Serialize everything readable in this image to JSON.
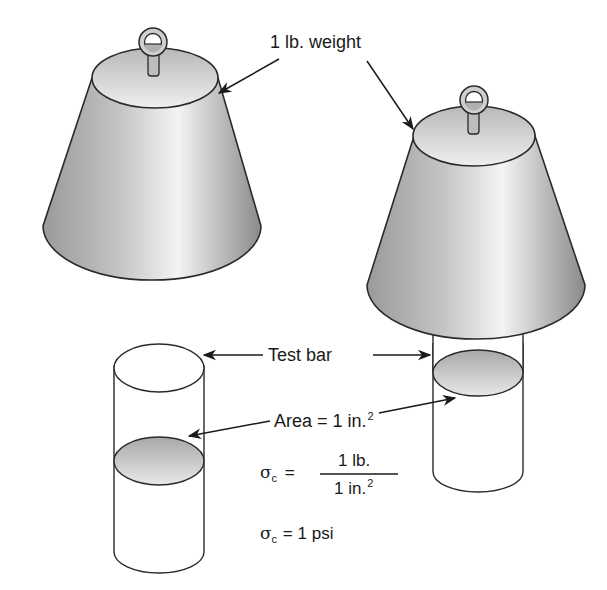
{
  "labels": {
    "weight": "1 lb. weight",
    "test_bar": "Test bar",
    "area_prefix": "Area = 1 in.",
    "area_exponent": "2"
  },
  "equations": {
    "stress_symbol": "σ",
    "stress_subscript": "c",
    "equals": "=",
    "numerator": "1 lb.",
    "denominator": "1 in.",
    "denominator_exponent": "2",
    "result_value": "= 1 psi"
  },
  "colors": {
    "outline": "#2a2a2a",
    "metal_dark": "#8c8c8c",
    "metal_mid": "#bdbdbd",
    "metal_light": "#f2f2f2",
    "background": "#ffffff"
  }
}
